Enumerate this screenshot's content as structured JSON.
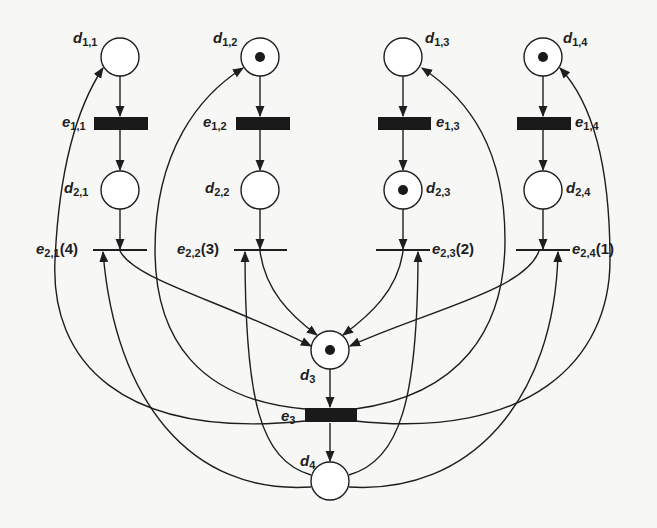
{
  "diagram": {
    "type": "petri-net",
    "colors": {
      "ink": "#1e1e1e",
      "background": "#f7f7f5",
      "token": "#1a1a1a"
    },
    "places": [
      {
        "id": "d11",
        "name": "d",
        "sub": "1,1",
        "x": 120,
        "y": 57,
        "tokens": 0
      },
      {
        "id": "d12",
        "name": "d",
        "sub": "1,2",
        "x": 260,
        "y": 57,
        "tokens": 1
      },
      {
        "id": "d13",
        "name": "d",
        "sub": "1,3",
        "x": 403,
        "y": 57,
        "tokens": 0
      },
      {
        "id": "d14",
        "name": "d",
        "sub": "1,4",
        "x": 543,
        "y": 57,
        "tokens": 1
      },
      {
        "id": "d21",
        "name": "d",
        "sub": "2,1",
        "x": 120,
        "y": 190,
        "tokens": 0
      },
      {
        "id": "d22",
        "name": "d",
        "sub": "2,2",
        "x": 260,
        "y": 190,
        "tokens": 0
      },
      {
        "id": "d23",
        "name": "d",
        "sub": "2,3",
        "x": 403,
        "y": 190,
        "tokens": 1
      },
      {
        "id": "d24",
        "name": "d",
        "sub": "2,4",
        "x": 543,
        "y": 190,
        "tokens": 0
      },
      {
        "id": "d3",
        "name": "d",
        "sub": "3",
        "x": 330,
        "y": 350,
        "tokens": 1
      },
      {
        "id": "d4",
        "name": "d",
        "sub": "4",
        "x": 330,
        "y": 481,
        "tokens": 0
      }
    ],
    "transitions": [
      {
        "id": "e11",
        "name": "e",
        "sub": "1,1",
        "suffix": "",
        "kind": "timed",
        "x": 120,
        "y": 123
      },
      {
        "id": "e12",
        "name": "e",
        "sub": "1,2",
        "suffix": "",
        "kind": "timed",
        "x": 260,
        "y": 123
      },
      {
        "id": "e13",
        "name": "e",
        "sub": "1,3",
        "suffix": "",
        "kind": "timed",
        "x": 403,
        "y": 123
      },
      {
        "id": "e14",
        "name": "e",
        "sub": "1,4",
        "suffix": "",
        "kind": "timed",
        "x": 543,
        "y": 123
      },
      {
        "id": "e21",
        "name": "e",
        "sub": "2,1",
        "suffix": "(4)",
        "kind": "immediate",
        "x": 120,
        "y": 250
      },
      {
        "id": "e22",
        "name": "e",
        "sub": "2,2",
        "suffix": "(3)",
        "kind": "immediate",
        "x": 260,
        "y": 250
      },
      {
        "id": "e23",
        "name": "e",
        "sub": "2,3",
        "suffix": "(2)",
        "kind": "immediate",
        "x": 403,
        "y": 250
      },
      {
        "id": "e24",
        "name": "e",
        "sub": "2,4",
        "suffix": "(1)",
        "kind": "immediate",
        "x": 543,
        "y": 250
      },
      {
        "id": "e3",
        "name": "e",
        "sub": "3",
        "suffix": "",
        "kind": "timed",
        "x": 330,
        "y": 415
      }
    ],
    "arcs": [
      [
        "d11",
        "e11"
      ],
      [
        "d12",
        "e12"
      ],
      [
        "d13",
        "e13"
      ],
      [
        "d14",
        "e14"
      ],
      [
        "e11",
        "d21"
      ],
      [
        "e12",
        "d22"
      ],
      [
        "e13",
        "d23"
      ],
      [
        "e14",
        "d24"
      ],
      [
        "d21",
        "e21"
      ],
      [
        "d22",
        "e22"
      ],
      [
        "d23",
        "e23"
      ],
      [
        "d24",
        "e24"
      ],
      [
        "e21",
        "d3"
      ],
      [
        "e22",
        "d3"
      ],
      [
        "e23",
        "d3"
      ],
      [
        "e24",
        "d3"
      ],
      [
        "d3",
        "e3"
      ],
      [
        "e3",
        "d4"
      ],
      [
        "e3",
        "d11"
      ],
      [
        "e3",
        "d12"
      ],
      [
        "e3",
        "d13"
      ],
      [
        "e3",
        "d14"
      ],
      [
        "d4",
        "e21"
      ],
      [
        "d4",
        "e22"
      ],
      [
        "d4",
        "e23"
      ],
      [
        "d4",
        "e24"
      ]
    ]
  },
  "labels": {
    "d11": {
      "name": "d",
      "sub": "1,1",
      "suffix": ""
    },
    "d12": {
      "name": "d",
      "sub": "1,2",
      "suffix": ""
    },
    "d13": {
      "name": "d",
      "sub": "1,3",
      "suffix": ""
    },
    "d14": {
      "name": "d",
      "sub": "1,4",
      "suffix": ""
    },
    "e11": {
      "name": "e",
      "sub": "1,1",
      "suffix": ""
    },
    "e12": {
      "name": "e",
      "sub": "1,2",
      "suffix": ""
    },
    "e13": {
      "name": "e",
      "sub": "1,3",
      "suffix": ""
    },
    "e14": {
      "name": "e",
      "sub": "1,4",
      "suffix": ""
    },
    "d21": {
      "name": "d",
      "sub": "2,1",
      "suffix": ""
    },
    "d22": {
      "name": "d",
      "sub": "2,2",
      "suffix": ""
    },
    "d23": {
      "name": "d",
      "sub": "2,3",
      "suffix": ""
    },
    "d24": {
      "name": "d",
      "sub": "2,4",
      "suffix": ""
    },
    "e21": {
      "name": "e",
      "sub": "2,1",
      "suffix": "(4)"
    },
    "e22": {
      "name": "e",
      "sub": "2,2",
      "suffix": "(3)"
    },
    "e23": {
      "name": "e",
      "sub": "2,3",
      "suffix": "(2)"
    },
    "e24": {
      "name": "e",
      "sub": "2,4",
      "suffix": "(1)"
    },
    "d3": {
      "name": "d",
      "sub": "3",
      "suffix": ""
    },
    "e3": {
      "name": "e",
      "sub": "3",
      "suffix": ""
    },
    "d4": {
      "name": "d",
      "sub": "4",
      "suffix": ""
    }
  }
}
